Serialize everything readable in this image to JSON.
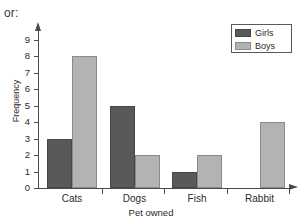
{
  "intro": {
    "text": "or:"
  },
  "chart_data": {
    "type": "bar",
    "title": "",
    "xlabel": "Pet owned",
    "ylabel": "Frequency",
    "categories": [
      "Cats",
      "Dogs",
      "Fish",
      "Rabbit"
    ],
    "series": [
      {
        "name": "Girls",
        "color": "#595959",
        "values": [
          3,
          5,
          1,
          0
        ]
      },
      {
        "name": "Boys",
        "color": "#b3b3b3",
        "values": [
          8,
          2,
          2,
          4
        ]
      }
    ],
    "ylim": [
      0,
      9
    ],
    "yticks": [
      0,
      1,
      2,
      3,
      4,
      5,
      6,
      7,
      8,
      9
    ],
    "ytick_labels": [
      "0",
      "1",
      "2",
      "3",
      "4",
      "5",
      "6",
      "7",
      "8",
      "9"
    ],
    "grid": false,
    "legend": {
      "position": "top-right",
      "entries": [
        "Girls",
        "Boys"
      ]
    }
  }
}
